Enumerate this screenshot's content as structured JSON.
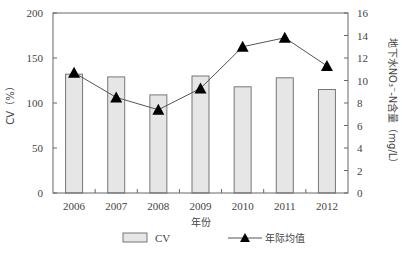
{
  "chart_data": {
    "type": "bar+line",
    "title": "",
    "categories": [
      "2006",
      "2007",
      "2008",
      "2009",
      "2010",
      "2011",
      "2012"
    ],
    "series": [
      {
        "name": "CV",
        "type": "bar",
        "axis": "left",
        "values": [
          132,
          129,
          109,
          130,
          118,
          128,
          115
        ],
        "color": "#e6e6e6",
        "edge_color": "#777777"
      },
      {
        "name": "年际均值",
        "type": "line",
        "axis": "right",
        "marker": "triangle",
        "values": [
          10.7,
          8.5,
          7.4,
          9.3,
          13.0,
          13.8,
          11.3
        ],
        "color": "#000000",
        "line_color": "#555555"
      }
    ],
    "xlabel": "年份",
    "ylabel": "CV（%）",
    "y2label": "地下水NO₃⁻-N含量（mg/L）",
    "ylim": [
      0,
      200
    ],
    "y2lim": [
      0,
      16
    ],
    "yticks": [
      0,
      50,
      100,
      150,
      200
    ],
    "y2ticks": [
      0,
      2,
      4,
      6,
      8,
      10,
      12,
      14,
      16
    ],
    "grid": false,
    "legend_position": "bottom"
  },
  "legend": {
    "bar_label": "CV",
    "line_label": "年际均值"
  }
}
